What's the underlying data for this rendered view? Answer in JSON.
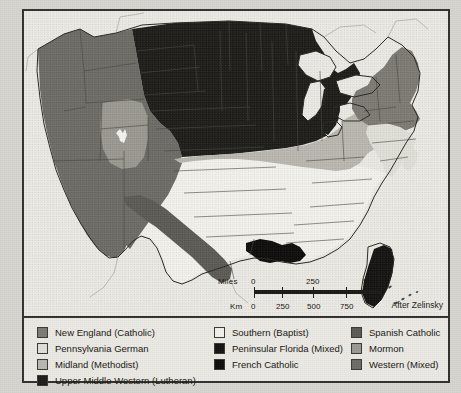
{
  "map": {
    "title": "Religious Regions of the United States",
    "credit": "After Zelinsky",
    "background_color": "#eceae4",
    "border_color": "#33312e",
    "state_line_color": "#4a4740"
  },
  "scale": {
    "miles_label": "Miles",
    "km_label": "Km",
    "miles_ticks": [
      "0",
      "250",
      "500"
    ],
    "km_ticks": [
      "0",
      "250",
      "500",
      "750"
    ]
  },
  "legend": {
    "columns": [
      {
        "items": [
          {
            "label": "New England (Catholic)",
            "color": "#7d7b74",
            "name": "new-england-catholic"
          },
          {
            "label": "Pennsylvania German",
            "color": "#e2e0d9",
            "name": "pennsylvania-german"
          },
          {
            "label": "Midland (Methodist)",
            "color": "#bab8b0",
            "name": "midland-methodist"
          },
          {
            "label": "Upper Middle Western (Lutheran)",
            "color": "#1e1d1a",
            "name": "upper-middle-western-lutheran"
          }
        ]
      },
      {
        "items": [
          {
            "label": "Southern (Baptist)",
            "color": "#f4f2ec",
            "name": "southern-baptist"
          },
          {
            "label": "Peninsular Florida (Mixed)",
            "color": "#151412",
            "name": "peninsular-florida-mixed"
          },
          {
            "label": "French Catholic",
            "color": "#0e0d0c",
            "name": "french-catholic"
          }
        ]
      },
      {
        "items": [
          {
            "label": "Spanish Catholic",
            "color": "#5d5b55",
            "name": "spanish-catholic"
          },
          {
            "label": "Mormon",
            "color": "#9b9992",
            "name": "mormon"
          },
          {
            "label": "Western (Mixed)",
            "color": "#6e6c66",
            "name": "western-mixed"
          }
        ]
      }
    ]
  },
  "chart_data": {
    "type": "map",
    "credit": "After Zelinsky",
    "projection_note": "conterminous United States, state outlines shown",
    "regions": [
      {
        "name": "Western (Mixed)",
        "color": "#6e6c66",
        "extent": "Pacific coast and Mountain West: WA, OR, CA, NV, ID, MT, WY, AZ, NM, western CO"
      },
      {
        "name": "Mormon",
        "color": "#9b9992",
        "extent": "Utah and adjacent southeastern Idaho / eastern Nevada; Great Salt Lake shown in white"
      },
      {
        "name": "Upper Middle Western (Lutheran)",
        "color": "#1e1d1a",
        "extent": "Dakotas, Minnesota, Wisconsin, Michigan, northern Iowa/Nebraska"
      },
      {
        "name": "Midland (Methodist)",
        "color": "#bab8b0",
        "extent": "Kansas, Nebraska, Iowa, Missouri, Illinois, Indiana, Ohio, West Virginia, western PA"
      },
      {
        "name": "New England (Catholic)",
        "color": "#7d7b74",
        "extent": "Maine, NH, VT, MA, RI, CT, New York, northern NJ"
      },
      {
        "name": "Pennsylvania German",
        "color": "#e2e0d9",
        "extent": "Pennsylvania, Maryland, Delaware, southern NJ"
      },
      {
        "name": "Southern (Baptist)",
        "color": "#f4f2ec",
        "extent": "Virginia, Carolinas, Georgia, Tennessee, Kentucky, Alabama, Mississippi, Arkansas, Oklahoma, most of Texas, northern Florida"
      },
      {
        "name": "Peninsular Florida (Mixed)",
        "color": "#151412",
        "extent": "Florida peninsula south of a line near Ocala"
      },
      {
        "name": "French Catholic",
        "color": "#0e0d0c",
        "extent": "southern Louisiana, Acadiana and the Gulf coast"
      },
      {
        "name": "Spanish Catholic",
        "color": "#5d5b55",
        "extent": "south and west Texas along the Rio Grande into southern New Mexico"
      }
    ],
    "scale_bar": {
      "miles": [
        0,
        250,
        500
      ],
      "km": [
        0,
        250,
        500,
        750
      ]
    },
    "legend_position": "bottom, three columns"
  }
}
